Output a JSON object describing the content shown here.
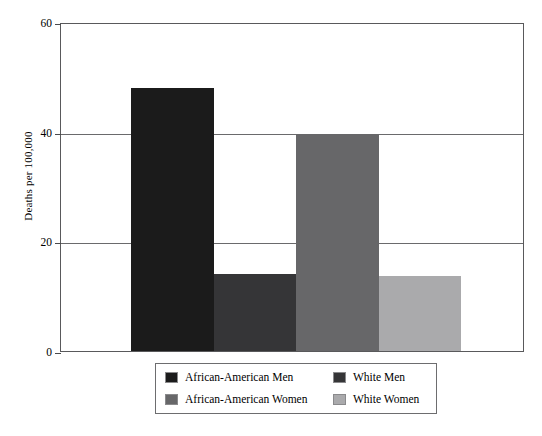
{
  "chart_data": {
    "type": "bar",
    "title": "",
    "xlabel": "",
    "ylabel": "Deaths per 100,000",
    "ylim": [
      0,
      60
    ],
    "yticks": [
      0,
      20,
      40,
      60
    ],
    "ytick_labels": [
      "0",
      "20",
      "40",
      "60"
    ],
    "grid": true,
    "legend_position": "below-center",
    "categories": [
      "African-American Men",
      "White Men",
      "African-American Women",
      "White Women"
    ],
    "values": [
      48,
      14,
      39.5,
      13.7
    ],
    "colors": [
      "#1b1b1b",
      "#353537",
      "#676769",
      "#aaaaac"
    ],
    "bars": [
      {
        "label": "African-American Men",
        "value": 48,
        "color": "#1b1b1b"
      },
      {
        "label": "White Men",
        "value": 14,
        "color": "#353537"
      },
      {
        "label": "African-American Women",
        "value": 39.5,
        "color": "#676769"
      },
      {
        "label": "White Women",
        "value": 13.7,
        "color": "#aaaaac"
      }
    ],
    "legend": [
      {
        "label": "African-American Men",
        "color": "#1b1b1b"
      },
      {
        "label": "White Men",
        "color": "#353537"
      },
      {
        "label": "African-American Women",
        "color": "#676769"
      },
      {
        "label": "White Women",
        "color": "#aaaaac"
      }
    ]
  },
  "axis": {
    "y_title": "Deaths per 100,000"
  }
}
